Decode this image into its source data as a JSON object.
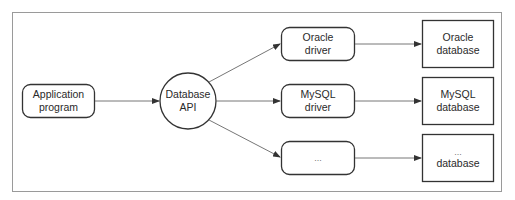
{
  "diagram": {
    "nodes": [
      {
        "id": "app",
        "line1": "Application",
        "line2": "program",
        "shape": "rounded-rect"
      },
      {
        "id": "api",
        "line1": "Database",
        "line2": "API",
        "shape": "circle"
      },
      {
        "id": "oracle_driver",
        "line1": "Oracle",
        "line2": "driver",
        "shape": "rounded-rect"
      },
      {
        "id": "mysql_driver",
        "line1": "MySQL",
        "line2": "driver",
        "shape": "rounded-rect"
      },
      {
        "id": "other_driver",
        "line1": "...",
        "shape": "rounded-rect"
      },
      {
        "id": "oracle_db",
        "line1": "Oracle",
        "line2": "database",
        "shape": "rect"
      },
      {
        "id": "mysql_db",
        "line1": "MySQL",
        "line2": "database",
        "shape": "rect"
      },
      {
        "id": "other_db",
        "line1": "...",
        "line2": "database",
        "shape": "rect"
      }
    ],
    "edges": [
      {
        "from": "app",
        "to": "api"
      },
      {
        "from": "api",
        "to": "oracle_driver"
      },
      {
        "from": "api",
        "to": "mysql_driver"
      },
      {
        "from": "api",
        "to": "other_driver"
      },
      {
        "from": "oracle_driver",
        "to": "oracle_db"
      },
      {
        "from": "mysql_driver",
        "to": "mysql_db"
      },
      {
        "from": "other_driver",
        "to": "other_db"
      }
    ],
    "colors": {
      "stroke": "#333333",
      "frame": "#999999",
      "edge": "#666666"
    }
  }
}
